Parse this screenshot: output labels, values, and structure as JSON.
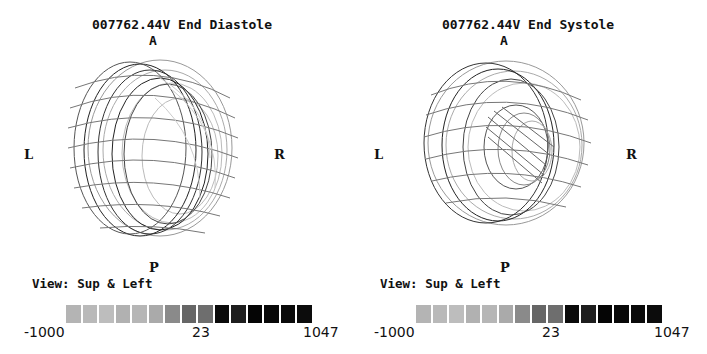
{
  "panels": [
    {
      "title": "007762.44V End Diastole",
      "orientation": {
        "anterior": "A",
        "posterior": "P",
        "left": "L",
        "right": "R"
      },
      "view_label": "View: Sup & Left",
      "scale": {
        "min": "-1000",
        "mid": "23",
        "max": "1047"
      }
    },
    {
      "title": "007762.44V End Systole",
      "orientation": {
        "anterior": "A",
        "posterior": "P",
        "left": "L",
        "right": "R"
      },
      "view_label": "View: Sup & Left",
      "scale": {
        "min": "-1000",
        "mid": "23",
        "max": "1047"
      }
    }
  ],
  "scale_colors": [
    "#b4b4b4",
    "#b9b9b9",
    "#bdbdbd",
    "#b1b1b1",
    "#b6b6b6",
    "#aaaaaa",
    "#8a8a8a",
    "#666666",
    "#6e6e6e",
    "#0a0a0a",
    "#1e1e1e",
    "#050505",
    "#080808",
    "#0a0a0a",
    "#0c0c0c"
  ]
}
